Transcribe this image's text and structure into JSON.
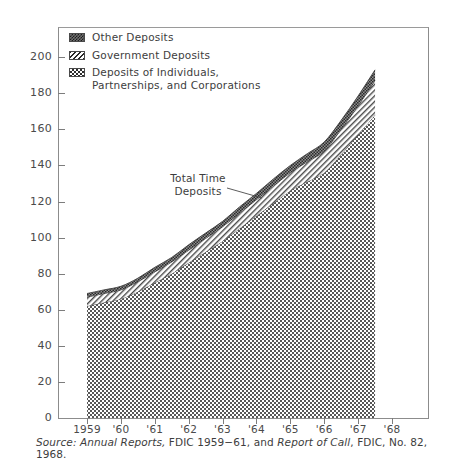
{
  "figure": {
    "title": "",
    "source_prefix": "Source:",
    "source_part1": " Annual Reports,",
    "source_part2": " FDIC 1959−61, and ",
    "source_part3": "Report of Call",
    "source_part4": ", FDIC, No. 82, 1968."
  },
  "annotation": {
    "label": "Total Time\nDeposits"
  },
  "legend": [
    {
      "label": "Other Deposits",
      "pattern": "dense-dark",
      "swatch_name": "legend-swatch-other-deposits"
    },
    {
      "label": "Government Deposits",
      "pattern": "diagonal-hatch",
      "swatch_name": "legend-swatch-government-deposits"
    },
    {
      "label": "Deposits of Individuals,\nPartnerships, and Corporations",
      "pattern": "checkerboard",
      "swatch_name": "legend-swatch-ipc-deposits"
    }
  ],
  "chart_data": {
    "type": "area",
    "title": "",
    "subtitle": "",
    "xlabel": "",
    "ylabel": "",
    "stacked": true,
    "grid": false,
    "legend_position": "top-left",
    "xlim": [
      1959,
      1968
    ],
    "ylim": [
      0,
      210
    ],
    "ytick_values": [
      0,
      20,
      40,
      60,
      80,
      100,
      120,
      140,
      160,
      180,
      200
    ],
    "ytick_labels": [
      "0",
      "20",
      "40",
      "60",
      "80",
      "100",
      "120",
      "140",
      "160",
      "180",
      "200"
    ],
    "xtick_values": [
      1959,
      1960,
      1961,
      1962,
      1963,
      1964,
      1965,
      1966,
      1967,
      1968
    ],
    "xtick_labels": [
      "1959",
      "'60",
      "'61",
      "'62",
      "'63",
      "'64",
      "'65",
      "'66",
      "'67",
      "'68"
    ],
    "x": [
      1959,
      1959.5,
      1960,
      1960.5,
      1961,
      1961.5,
      1962,
      1962.5,
      1963,
      1963.5,
      1964,
      1964.5,
      1965,
      1965.5,
      1966,
      1966.5,
      1967,
      1967.5
    ],
    "series": [
      {
        "name": "Deposits of Individuals, Partnerships, and Corporations",
        "pattern": "checkerboard",
        "values": [
          62,
          64,
          66,
          70,
          75,
          80,
          86,
          92,
          98,
          105,
          112,
          119,
          126,
          131,
          136,
          146,
          157,
          168
        ]
      },
      {
        "name": "Government Deposits",
        "pattern": "diagonal-hatch",
        "values": [
          5,
          5,
          5,
          5.5,
          6,
          6.5,
          7,
          7.5,
          8,
          8.5,
          9,
          9.5,
          10,
          11,
          12,
          14,
          16,
          19
        ]
      },
      {
        "name": "Other Deposits",
        "pattern": "dense-dark",
        "values": [
          2,
          2,
          2,
          2,
          2.5,
          2.5,
          3,
          3,
          3,
          3.5,
          3.5,
          4,
          4,
          4.5,
          5,
          5,
          5.5,
          6
        ]
      }
    ],
    "totals": [
      69,
      71,
      73,
      77.5,
      83.5,
      89,
      96,
      102.5,
      109,
      117,
      124.5,
      132.5,
      140,
      146.5,
      153,
      165,
      178.5,
      193
    ],
    "units": "billions of dollars"
  }
}
